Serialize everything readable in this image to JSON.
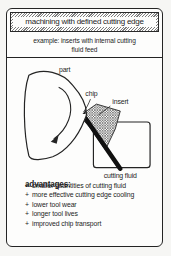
{
  "header": {
    "title": "machining with defined cutting edge"
  },
  "example": {
    "line1": "example: inserts with internal cutting",
    "line2": "fluid feed"
  },
  "diagram": {
    "labels": {
      "part": "part",
      "chip": "chip",
      "insert": "insert",
      "cutting_fluid": "cutting fluid"
    }
  },
  "advantages": {
    "heading": "advantages:",
    "bullet": "+",
    "items": [
      "smaller quantities of cutting fluid",
      "more effective cutting edge cooling",
      "lower tool wear",
      "longer tool lives",
      "improved chip transport"
    ]
  },
  "colors": {
    "ink": "#1e1e1e",
    "paper": "#fdfdfc"
  }
}
